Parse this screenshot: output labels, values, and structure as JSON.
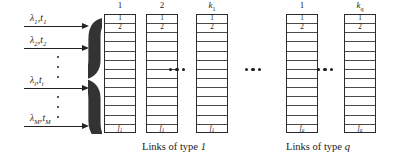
{
  "figure": {
    "type": "queueing-network-schematic",
    "background": "#ffffff",
    "ink": "#222222"
  },
  "arrivals": {
    "name": "arrival-streams",
    "rows": [
      {
        "id": "arr-1",
        "lambda": "λ",
        "lambda_sub": "1",
        "t": "t",
        "t_sub": "1",
        "label": "λ₁,t₁",
        "top": 26
      },
      {
        "id": "arr-2",
        "lambda": "λ",
        "lambda_sub": "2",
        "t": "t",
        "t_sub": "2",
        "label": "λ₂,t₂",
        "top": 48
      },
      {
        "id": "arr-i",
        "lambda": "λ",
        "lambda_sub": "i",
        "t": "t",
        "t_sub": "i",
        "label": "λᵢ,tᵢ",
        "top": 88
      },
      {
        "id": "arr-M",
        "lambda": "λ",
        "lambda_sub": "M",
        "t": "t",
        "t_sub": "M",
        "label": "λₘ,tₘ",
        "top": 126
      }
    ],
    "vertical_ellipses": [
      {
        "id": "vdots-upper",
        "top": 56,
        "left": 56,
        "height": 22,
        "count": 3
      },
      {
        "id": "vdots-lower",
        "top": 96,
        "left": 56,
        "height": 22,
        "count": 3
      }
    ]
  },
  "brace": {
    "glyph": "{",
    "name": "grouping-brace"
  },
  "groups": [
    {
      "id": "type-1",
      "caption": "Links of type 1",
      "caption_plain": "Links of type ",
      "caption_em": "1",
      "caption_left": 142,
      "columns": [
        {
          "id": "t1-c1",
          "header": "1",
          "header_italic": false,
          "left": 104,
          "top_cells": [
            "1",
            "2"
          ],
          "bottom_cell": "f₁",
          "bottom_base": "f",
          "bottom_sub": "1",
          "rows": 13
        },
        {
          "id": "t1-c2",
          "header": "2",
          "header_italic": false,
          "left": 146,
          "top_cells": [
            "1",
            "2"
          ],
          "bottom_cell": "f₁",
          "bottom_base": "f",
          "bottom_sub": "1",
          "rows": 13
        },
        {
          "id": "t1-ck",
          "header": "k₁",
          "header_italic": true,
          "header_base": "k",
          "header_sub": "1",
          "left": 196,
          "top_cells": [
            "1",
            "2"
          ],
          "bottom_cell": "f₁",
          "bottom_base": "f",
          "bottom_sub": "1",
          "rows": 13
        }
      ],
      "inner_ellipsis": {
        "id": "dots-t1-inner",
        "left": 169,
        "top": 68,
        "count": 3
      }
    },
    {
      "id": "type-q",
      "caption": "Links of type q",
      "caption_plain": "Links of type ",
      "caption_em": "q",
      "caption_left": 286,
      "columns": [
        {
          "id": "tq-c1",
          "header": "1",
          "header_italic": false,
          "left": 286,
          "top_cells": [
            "1",
            "2"
          ],
          "bottom_cell": "fৠ",
          "bottom_base": "f",
          "bottom_sub": "q",
          "rows": 13
        },
        {
          "id": "tq-ck",
          "header": "kৠ",
          "header_italic": true,
          "header_base": "k",
          "header_sub": "q",
          "left": 344,
          "top_cells": [
            "1",
            "2"
          ],
          "bottom_cell": "fৠ",
          "bottom_base": "f",
          "bottom_sub": "q",
          "rows": 13
        }
      ],
      "inner_ellipsis": {
        "id": "dots-tq-inner",
        "left": 317,
        "top": 68,
        "count": 3
      }
    }
  ],
  "between_group_ellipsis": {
    "id": "dots-between-groups",
    "left": 245,
    "top": 68,
    "count": 3
  },
  "labels": {
    "row_1": "1",
    "row_2": "2"
  }
}
